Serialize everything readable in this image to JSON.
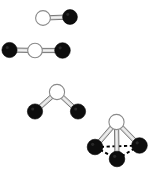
{
  "figure": {
    "width": 154,
    "height": 177,
    "background_color": "#ffffff",
    "atom_types": {
      "white": {
        "name": "white-atom",
        "fill": "#ffffff",
        "stroke": "#8a8a8a",
        "stroke_width": 1.1,
        "radius": 7.2
      },
      "black": {
        "name": "black-atom",
        "fill": "#0d0d0d",
        "stroke": "#000000",
        "stroke_width": 0.6,
        "radius": 7.4
      }
    },
    "bond_style": {
      "name": "solid-cylinder-bond",
      "fill": "#d7d7d7",
      "stroke": "#5a5a5a",
      "stroke_width": 0.8,
      "thickness": 4.2
    },
    "dashed_style": {
      "name": "dashed-base-edge",
      "stroke": "#000000",
      "stroke_width": 1.9,
      "dash_pattern": "3.2 2.6"
    }
  },
  "models": [
    {
      "id": "model-1",
      "name": "diatomic-linear-model",
      "geometry": "linear",
      "label": "Diatomic molecule",
      "atom_count": 2,
      "bond_count": 1,
      "atoms": [
        {
          "id": "a1",
          "type": "white",
          "cx": 43.0,
          "cy": 18.0,
          "r": 7.4
        },
        {
          "id": "a2",
          "type": "black",
          "cx": 70.0,
          "cy": 17.0,
          "r": 7.4
        }
      ],
      "bonds": [
        {
          "from": "a1",
          "to": "a2",
          "style": "solid"
        }
      ],
      "dashed_edges": []
    },
    {
      "id": "model-2",
      "name": "linear-triatomic-model",
      "geometry": "linear",
      "label": "Linear triatomic molecule",
      "atom_count": 3,
      "bond_count": 2,
      "atoms": [
        {
          "id": "b1",
          "type": "black",
          "cx": 9.5,
          "cy": 50.0,
          "r": 7.6
        },
        {
          "id": "b2",
          "type": "white",
          "cx": 35.0,
          "cy": 50.5,
          "r": 7.3
        },
        {
          "id": "b3",
          "type": "black",
          "cx": 62.5,
          "cy": 50.5,
          "r": 7.8
        }
      ],
      "bonds": [
        {
          "from": "b1",
          "to": "b2",
          "style": "solid"
        },
        {
          "from": "b2",
          "to": "b3",
          "style": "solid"
        }
      ],
      "dashed_edges": []
    },
    {
      "id": "model-3",
      "name": "bent-triatomic-model",
      "geometry": "bent",
      "label": "Bent triatomic molecule",
      "atom_count": 3,
      "bond_count": 2,
      "atoms": [
        {
          "id": "c1",
          "type": "white",
          "cx": 57.0,
          "cy": 92.0,
          "r": 7.6
        },
        {
          "id": "c2",
          "type": "black",
          "cx": 35.0,
          "cy": 111.5,
          "r": 7.6
        },
        {
          "id": "c3",
          "type": "black",
          "cx": 78.0,
          "cy": 111.5,
          "r": 7.6
        }
      ],
      "bonds": [
        {
          "from": "c1",
          "to": "c2",
          "style": "solid"
        },
        {
          "from": "c1",
          "to": "c3",
          "style": "solid"
        }
      ],
      "dashed_edges": []
    },
    {
      "id": "model-4",
      "name": "trigonal-pyramidal-model",
      "geometry": "trigonal-pyramidal",
      "label": "Trigonal pyramidal molecule",
      "atom_count": 4,
      "bond_count": 3,
      "atoms": [
        {
          "id": "d1",
          "type": "white",
          "cx": 116.5,
          "cy": 122.0,
          "r": 7.6
        },
        {
          "id": "d2",
          "type": "black",
          "cx": 95.0,
          "cy": 147.0,
          "r": 7.8
        },
        {
          "id": "d3",
          "type": "black",
          "cx": 139.5,
          "cy": 145.5,
          "r": 7.8
        },
        {
          "id": "d4",
          "type": "black",
          "cx": 117.0,
          "cy": 159.0,
          "r": 7.8
        }
      ],
      "bonds": [
        {
          "from": "d1",
          "to": "d2",
          "style": "solid"
        },
        {
          "from": "d1",
          "to": "d3",
          "style": "solid"
        },
        {
          "from": "d1",
          "to": "d4",
          "style": "solid"
        }
      ],
      "dashed_edges": [
        {
          "from": "d2",
          "to": "d3"
        },
        {
          "from": "d2",
          "to": "d4"
        },
        {
          "from": "d3",
          "to": "d4"
        }
      ]
    }
  ]
}
